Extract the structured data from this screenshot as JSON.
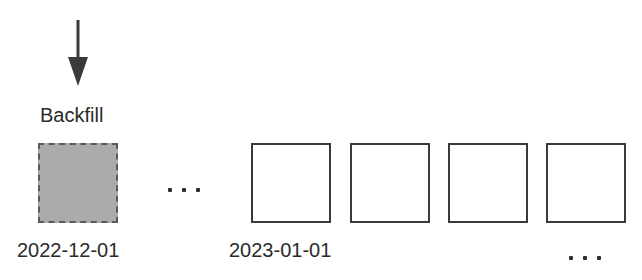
{
  "diagram": {
    "arrow": {
      "direction": "down",
      "color": "#3a3a3a"
    },
    "backfill_label": "Backfill",
    "colors": {
      "backfill_fill": "#ababab",
      "backfill_border": "#5a5a5a",
      "box_border": "#3a3a3a",
      "text": "#2b2b2b"
    },
    "boxes": [
      {
        "id": "backfill",
        "style": "dashed-gray"
      },
      {
        "id": "box-1",
        "style": "solid-empty"
      },
      {
        "id": "box-2",
        "style": "solid-empty"
      },
      {
        "id": "box-3",
        "style": "solid-empty"
      },
      {
        "id": "box-4",
        "style": "solid-empty"
      }
    ],
    "date_labels": [
      {
        "text": "2022-12-01",
        "under": "backfill"
      },
      {
        "text": "2023-01-01",
        "under": "box-1"
      }
    ],
    "ellipsis_between": "...",
    "ellipsis_trailing": "..."
  }
}
